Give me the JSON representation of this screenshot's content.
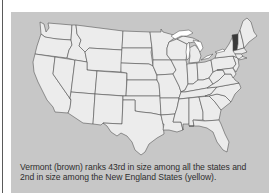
{
  "figure": {
    "title": "",
    "caption_line1": "Vermont (brown) ranks 43rd in size among all the states and",
    "caption_line2": "2nd in size among the New England States (yellow).",
    "highlighted_state": "Vermont",
    "colors": {
      "background": "#c7c7c7",
      "state_fill": "#ececec",
      "state_outline": "#4a4a4a",
      "highlight": "#3a3a3a",
      "caption_text": "#2e2e2e"
    }
  }
}
